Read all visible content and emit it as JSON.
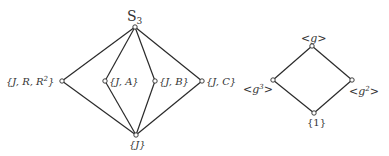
{
  "diagrams": [
    {
      "name": "subgroup-lattice-S3",
      "nodes": [
        {
          "id": "S3",
          "label_main": "S",
          "label_sub": "3",
          "x": 135,
          "y": 27
        },
        {
          "id": "JRR2",
          "label": "{J, R, R",
          "label_sup": "2",
          "label_end": "}",
          "x": 62,
          "y": 81
        },
        {
          "id": "JA",
          "label": "{J, A}",
          "x": 105,
          "y": 81
        },
        {
          "id": "JB",
          "label": "{J, B}",
          "x": 155,
          "y": 81
        },
        {
          "id": "JC",
          "label": "{J, C}",
          "x": 202,
          "y": 81
        },
        {
          "id": "J",
          "label": "{J}",
          "x": 136,
          "y": 135
        }
      ],
      "edges": [
        [
          "S3",
          "JRR2"
        ],
        [
          "S3",
          "JA"
        ],
        [
          "S3",
          "JB"
        ],
        [
          "S3",
          "JC"
        ],
        [
          "JRR2",
          "J"
        ],
        [
          "JA",
          "J"
        ],
        [
          "JB",
          "J"
        ],
        [
          "JC",
          "J"
        ]
      ]
    },
    {
      "name": "subgroup-lattice-cyclic",
      "nodes": [
        {
          "id": "g",
          "label": "<g>",
          "x": 312,
          "y": 46
        },
        {
          "id": "g3",
          "label": "<g",
          "label_sup": "3",
          "label_end": ">",
          "x": 273,
          "y": 80
        },
        {
          "id": "g2",
          "label": "<g",
          "label_sup": "2",
          "label_end": ">",
          "x": 352,
          "y": 80
        },
        {
          "id": "one",
          "label": "{1}",
          "x": 314,
          "y": 113
        }
      ],
      "edges": [
        [
          "g",
          "g3"
        ],
        [
          "g",
          "g2"
        ],
        [
          "g3",
          "one"
        ],
        [
          "g2",
          "one"
        ]
      ]
    }
  ],
  "labels": {
    "s3_main": "S",
    "s3_sub": "3",
    "jrr2_text": "{J, R, R",
    "jrr2_sup": "2",
    "jrr2_end": "}",
    "ja_text": "{J, A}",
    "jb_text": "{J, B}",
    "jc_text": "{J, C}",
    "j_text": "{J}",
    "g_text": "<g>",
    "g3_text": "<g",
    "g3_sup": "3",
    "g3_end": ">",
    "g2_text": "<g",
    "g2_sup": "2",
    "g2_end": ">",
    "one_text": "{1}"
  }
}
